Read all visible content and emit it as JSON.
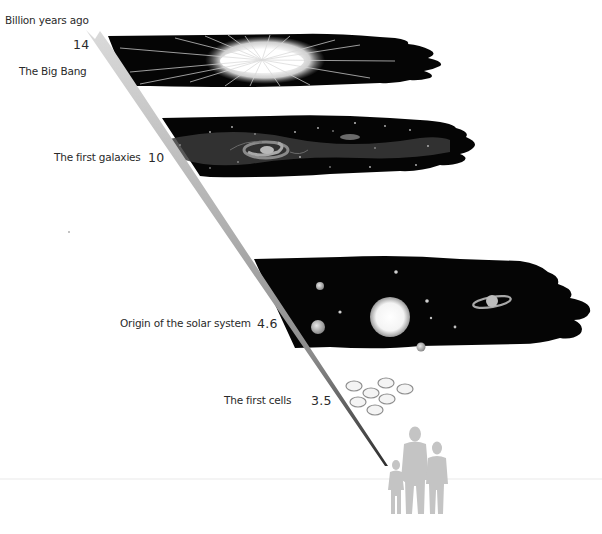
{
  "axis": {
    "title": "Billion years ago"
  },
  "events": [
    {
      "label": "The Big Bang",
      "value": "14",
      "scene": "big-bang"
    },
    {
      "label": "The first galaxies",
      "value": "10",
      "scene": "galaxies"
    },
    {
      "label": "Origin of the solar system",
      "value": "4.6",
      "scene": "solar-system"
    },
    {
      "label": "The first cells",
      "value": "3.5",
      "scene": "cells"
    }
  ],
  "colors": {
    "space": "#050505",
    "wedge_top": "#d6d6d6",
    "wedge_bottom": "#3a3a3a",
    "figures": "#c4c4c4",
    "cells_stroke": "#8e8e8e",
    "text": "#2a2a2a"
  }
}
